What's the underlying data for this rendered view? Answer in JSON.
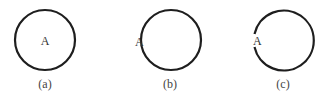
{
  "figure": {
    "panels": [
      {
        "id": "a",
        "caption": "(a)",
        "point_label": "A",
        "point_position": "inside-center",
        "circle": "closed"
      },
      {
        "id": "b",
        "caption": "(b)",
        "point_label": "A",
        "point_position": "outside-left",
        "circle": "closed"
      },
      {
        "id": "c",
        "caption": "(c)",
        "point_label": "A",
        "point_position": "on-circle-left",
        "circle": "open-at-left"
      }
    ],
    "colors": {
      "stroke": "#1e1e1e",
      "text": "#333333",
      "background": "#ffffff"
    }
  }
}
